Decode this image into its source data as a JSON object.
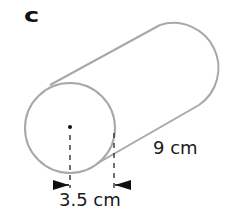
{
  "figure": {
    "part_label": "c",
    "shape": "cylinder",
    "dimensions": {
      "radius_label": "3.5 cm",
      "length_label": "9 cm"
    },
    "colors": {
      "outline": "#a8a8a8",
      "text": "#1a1a1a",
      "markers": "#111111"
    }
  }
}
